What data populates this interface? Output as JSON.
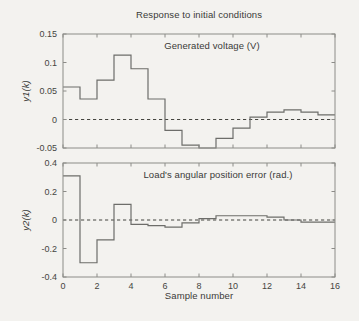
{
  "figure": {
    "title": "Response to initial conditions",
    "xlabel": "Sample number",
    "background": "#f3f2ef",
    "line_color": "#6d6d6a",
    "axis_color": "#8c8c88",
    "dashed_zero_color": "#454540",
    "text_color": "#3a3a38"
  },
  "chart_data": [
    {
      "type": "stairs",
      "annotation": "Generated voltage (V)",
      "ylabel": "y1(k)",
      "xlim": [
        0,
        16
      ],
      "ylim": [
        -0.05,
        0.15
      ],
      "x": [
        0,
        1,
        2,
        3,
        4,
        5,
        6,
        7,
        8,
        9,
        10,
        11,
        12,
        13,
        14,
        15,
        16
      ],
      "values": [
        0.057,
        0.036,
        0.069,
        0.113,
        0.089,
        0.036,
        -0.019,
        -0.045,
        -0.05,
        -0.033,
        -0.015,
        0.004,
        0.013,
        0.017,
        0.013,
        0.008,
        0.008
      ],
      "yticks": [
        0.15,
        0.1,
        0.05,
        0,
        -0.05
      ],
      "ytick_labels": [
        "0.15",
        "0.1",
        "0.05",
        "0",
        "-0.05"
      ],
      "xticks": [
        0,
        2,
        4,
        6,
        8,
        10,
        12,
        14,
        16
      ],
      "xtick_labels": [],
      "zero_line": "dashed",
      "grid": false
    },
    {
      "type": "stairs",
      "annotation": "Load's angular position error (rad.)",
      "ylabel": "y2(k)",
      "xlim": [
        0,
        16
      ],
      "ylim": [
        -0.4,
        0.4
      ],
      "x": [
        0,
        1,
        2,
        3,
        4,
        5,
        6,
        7,
        8,
        9,
        10,
        11,
        12,
        13,
        14,
        15,
        16
      ],
      "values": [
        0.31,
        -0.3,
        -0.14,
        0.11,
        -0.03,
        -0.04,
        -0.05,
        -0.02,
        0.01,
        0.03,
        0.03,
        0.03,
        0.02,
        0.0,
        -0.015,
        -0.015,
        -0.015
      ],
      "yticks": [
        0.4,
        0.2,
        0,
        -0.2,
        -0.4
      ],
      "ytick_labels": [
        "0.4",
        "0.2",
        "0",
        "-0.2",
        "-0.4"
      ],
      "xticks": [
        0,
        2,
        4,
        6,
        8,
        10,
        12,
        14,
        16
      ],
      "xtick_labels": [
        "0",
        "2",
        "4",
        "6",
        "8",
        "10",
        "12",
        "14",
        "16"
      ],
      "zero_line": "dashed",
      "grid": false
    }
  ]
}
